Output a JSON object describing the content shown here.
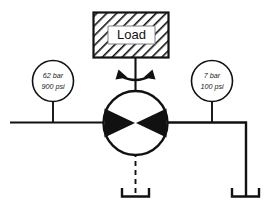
{
  "diagram": {
    "background_color": "#ffffff",
    "line_color": "#111111"
  },
  "load": {
    "label": "Load",
    "hatch_pattern": "diagonal-hatch",
    "hatch_color": "#111111",
    "fill_color": "#ffffff"
  },
  "gauges": [
    {
      "id": "left-gauge",
      "name": "pressure-gauge-left",
      "line_1": "62 bar",
      "line_2": "900 psi",
      "value_bar": 62,
      "value_psi": 900
    },
    {
      "id": "right-gauge",
      "name": "pressure-gauge-right",
      "line_1": "7 bar",
      "line_2": "100 psi",
      "value_bar": 7,
      "value_psi": 100
    }
  ],
  "motor": {
    "name": "bidirectional-hydraulic-motor",
    "symbol": "circle-with-two-solid-triangles",
    "rotation": "bidirectional",
    "rotation_arrow": "double-curved-arrow"
  },
  "lines": {
    "supply_line": "horizontal-left-port-line",
    "return_line": "right-port-line-to-tank",
    "drain_line": "dashed-case-drain-line",
    "shaft_line": "motor-shaft-to-load"
  },
  "tanks": [
    {
      "id": "drain-tank",
      "name": "reservoir-drain",
      "symbol": "open-top-tank"
    },
    {
      "id": "return-tank",
      "name": "reservoir-return",
      "symbol": "open-top-tank"
    }
  ]
}
